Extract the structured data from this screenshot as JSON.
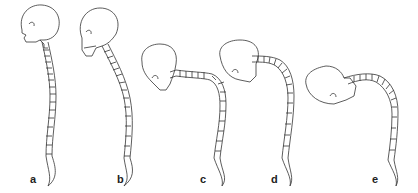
{
  "diagram": {
    "type": "illustration",
    "panels": [
      {
        "id": "a",
        "label": "a",
        "posture": "upright, neutral spine"
      },
      {
        "id": "b",
        "label": "b",
        "posture": "slight forward lean, mild kyphosis"
      },
      {
        "id": "c",
        "label": "c",
        "posture": "head forward and lowered, cervical spine horizontal"
      },
      {
        "id": "d",
        "label": "d",
        "posture": "marked kyphosis, head forward"
      },
      {
        "id": "e",
        "label": "e",
        "posture": "severe kyphosis, head far forward and rotated"
      }
    ]
  },
  "colors": {
    "background": "#ffffff",
    "line": "#333333",
    "label": "#222222"
  }
}
